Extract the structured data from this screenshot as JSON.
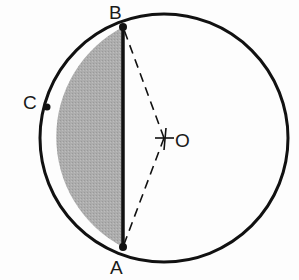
{
  "diagram": {
    "type": "circle-segment",
    "circle": {
      "center_label": "O",
      "cx": 164,
      "cy": 138,
      "r": 124
    },
    "points": [
      {
        "label": "A",
        "x": 123,
        "y": 247
      },
      {
        "label": "B",
        "x": 123,
        "y": 27
      },
      {
        "label": "C",
        "x": 47,
        "y": 107
      }
    ],
    "chord": {
      "from": "A",
      "to": "B",
      "style": "solid-bold"
    },
    "radii": [
      {
        "from": "O",
        "to": "A",
        "style": "dashed"
      },
      {
        "from": "O",
        "to": "B",
        "style": "dashed"
      }
    ],
    "shaded_region": {
      "description": "minor segment bounded by chord AB and arc ACB",
      "fill": "#a9a9a9"
    },
    "labels": {
      "A": "A",
      "B": "B",
      "C": "C",
      "O": "O"
    },
    "colors": {
      "stroke": "#111111",
      "shade": "#a9a9a9",
      "background": "#fdfdfd"
    }
  }
}
